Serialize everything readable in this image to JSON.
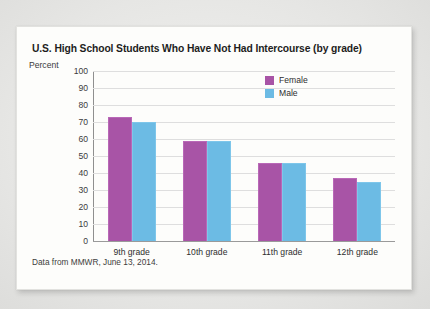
{
  "card": {
    "title": "U.S. High School Students Who Have Not Had Intercourse (by grade)",
    "source_note": "Data from MMWR, June 13, 2014."
  },
  "colors": {
    "female": "#a854a6",
    "male": "#6cbbe4",
    "gridline": "#dedede",
    "axis": "#8f8f8f",
    "card_background": "#fdfdfb",
    "page_background": "#e9e9e9"
  },
  "legend": {
    "position": "top-right",
    "items": [
      {
        "label": "Female",
        "color": "#a854a6"
      },
      {
        "label": "Male",
        "color": "#6cbbe4"
      }
    ]
  },
  "chart_data": {
    "type": "bar",
    "title": "U.S. High School Students Who Have Not Had Intercourse (by grade)",
    "xlabel": "",
    "ylabel": "Percent",
    "ylim": [
      0,
      100
    ],
    "yticks": [
      100,
      90,
      80,
      70,
      60,
      50,
      40,
      30,
      20,
      10,
      0
    ],
    "grid": true,
    "categories": [
      "9th grade",
      "10th grade",
      "11th grade",
      "12th grade"
    ],
    "series": [
      {
        "name": "Female",
        "color": "#a854a6",
        "values": [
          73,
          59,
          46,
          37
        ]
      },
      {
        "name": "Male",
        "color": "#6cbbe4",
        "values": [
          70,
          59,
          46,
          35
        ]
      }
    ],
    "annotations": [
      "Data from MMWR, June 13, 2014."
    ]
  }
}
